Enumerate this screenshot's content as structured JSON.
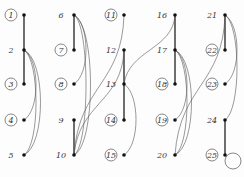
{
  "diagram": {
    "type": "graph-drawings",
    "columns": 5,
    "nodes": [
      {
        "id": "1",
        "x": 24,
        "y": 15,
        "circled": true
      },
      {
        "id": "2",
        "x": 24,
        "y": 50,
        "circled": false
      },
      {
        "id": "3",
        "x": 24,
        "y": 84,
        "circled": true
      },
      {
        "id": "4",
        "x": 24,
        "y": 120,
        "circled": true
      },
      {
        "id": "5",
        "x": 24,
        "y": 155,
        "circled": false
      },
      {
        "id": "6",
        "x": 74,
        "y": 15,
        "circled": false
      },
      {
        "id": "7",
        "x": 74,
        "y": 50,
        "circled": true
      },
      {
        "id": "8",
        "x": 74,
        "y": 84,
        "circled": true
      },
      {
        "id": "9",
        "x": 74,
        "y": 120,
        "circled": false
      },
      {
        "id": "10",
        "x": 74,
        "y": 155,
        "circled": false
      },
      {
        "id": "11",
        "x": 124,
        "y": 15,
        "circled": true
      },
      {
        "id": "12",
        "x": 124,
        "y": 50,
        "circled": false
      },
      {
        "id": "13",
        "x": 124,
        "y": 84,
        "circled": false
      },
      {
        "id": "14",
        "x": 124,
        "y": 120,
        "circled": true
      },
      {
        "id": "15",
        "x": 124,
        "y": 155,
        "circled": true
      },
      {
        "id": "16",
        "x": 175,
        "y": 15,
        "circled": false
      },
      {
        "id": "17",
        "x": 175,
        "y": 50,
        "circled": false
      },
      {
        "id": "18",
        "x": 175,
        "y": 84,
        "circled": true
      },
      {
        "id": "19",
        "x": 175,
        "y": 120,
        "circled": true
      },
      {
        "id": "20",
        "x": 175,
        "y": 155,
        "circled": false
      },
      {
        "id": "21",
        "x": 225,
        "y": 15,
        "circled": false
      },
      {
        "id": "22",
        "x": 225,
        "y": 50,
        "circled": true
      },
      {
        "id": "23",
        "x": 225,
        "y": 84,
        "circled": true
      },
      {
        "id": "24",
        "x": 225,
        "y": 120,
        "circled": false
      },
      {
        "id": "25",
        "x": 225,
        "y": 155,
        "circled": true
      }
    ],
    "straight_edges": [
      [
        "1",
        "2"
      ],
      [
        "2",
        "3"
      ],
      [
        "6",
        "7"
      ],
      [
        "9",
        "10"
      ],
      [
        "12",
        "13"
      ],
      [
        "13",
        "14"
      ],
      [
        "16",
        "17"
      ],
      [
        "17",
        "18"
      ],
      [
        "21",
        "22"
      ],
      [
        "24",
        "25"
      ]
    ],
    "curved_edges": [
      [
        "2",
        "4"
      ],
      [
        "2",
        "5"
      ],
      [
        "2",
        "5"
      ],
      [
        "6",
        "8"
      ],
      [
        "6",
        "10"
      ],
      [
        "6",
        "10"
      ],
      [
        "11",
        "10"
      ],
      [
        "12",
        "10"
      ],
      [
        "16",
        "13"
      ],
      [
        "13",
        "15"
      ],
      [
        "17",
        "19"
      ],
      [
        "17",
        "20"
      ],
      [
        "17",
        "20"
      ],
      [
        "21",
        "20"
      ],
      [
        "21",
        "23"
      ],
      [
        "21",
        "24"
      ]
    ],
    "loops": [
      "25"
    ]
  }
}
